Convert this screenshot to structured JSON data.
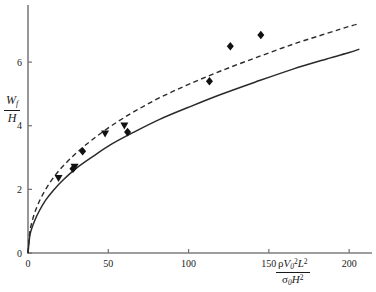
{
  "chart_data": {
    "type": "scatter",
    "title": "",
    "subtitle": "",
    "xlabel": "rho V_0^2 L^2 / (sigma_0 H^2)",
    "ylabel": "W_f / H",
    "xlabel_parts": {
      "numerator": "ρV₀²L²",
      "denominator": "σ₀H²"
    },
    "ylabel_parts": {
      "numerator": "Wₑ",
      "denominator": "H"
    },
    "xlim": [
      0,
      208
    ],
    "ylim": [
      0,
      7.7
    ],
    "xticks": [
      0,
      50,
      100,
      150,
      200
    ],
    "xticklabels": [
      "0",
      "50",
      "100",
      "150",
      "200"
    ],
    "yticks": [
      0,
      2,
      4,
      6
    ],
    "yticklabels": [
      "0",
      "2",
      "4",
      "6"
    ],
    "grid": false,
    "legend": false,
    "legend_position": "none",
    "annotations": [],
    "series": [
      {
        "name": "upper-theory-curve",
        "type": "line",
        "style": "dashed",
        "color": "#2a2a2c",
        "x": [
          0,
          1,
          2,
          4,
          7,
          11,
          16,
          22,
          30,
          40,
          52,
          66,
          82,
          100,
          120,
          142,
          165,
          186,
          200,
          206
        ],
        "y": [
          0,
          0.62,
          0.88,
          1.24,
          1.62,
          2.0,
          2.38,
          2.74,
          3.14,
          3.56,
          4.0,
          4.44,
          4.88,
          5.3,
          5.72,
          6.14,
          6.56,
          6.9,
          7.12,
          7.2
        ]
      },
      {
        "name": "lower-theory-curve",
        "type": "line",
        "style": "solid",
        "color": "#2a2a2c",
        "x": [
          0,
          1,
          2,
          4,
          7,
          11,
          16,
          22,
          30,
          40,
          52,
          66,
          82,
          100,
          120,
          142,
          165,
          186,
          200,
          206
        ],
        "y": [
          0,
          0.5,
          0.72,
          1.0,
          1.32,
          1.66,
          1.98,
          2.3,
          2.66,
          3.02,
          3.42,
          3.8,
          4.2,
          4.58,
          4.98,
          5.38,
          5.78,
          6.1,
          6.3,
          6.4
        ]
      },
      {
        "name": "diamond-data",
        "type": "scatter",
        "marker": "diamond",
        "color": "#111113",
        "points": [
          {
            "x": 28,
            "y": 2.65
          },
          {
            "x": 34,
            "y": 3.2
          },
          {
            "x": 62,
            "y": 3.8
          },
          {
            "x": 113,
            "y": 5.4
          },
          {
            "x": 126,
            "y": 6.5
          },
          {
            "x": 145,
            "y": 6.85
          }
        ]
      },
      {
        "name": "triangle-data",
        "type": "scatter",
        "marker": "triangle-down",
        "color": "#111113",
        "points": [
          {
            "x": 19,
            "y": 2.35
          },
          {
            "x": 29,
            "y": 2.7
          },
          {
            "x": 48,
            "y": 3.75
          },
          {
            "x": 60,
            "y": 4.0
          }
        ]
      }
    ]
  }
}
